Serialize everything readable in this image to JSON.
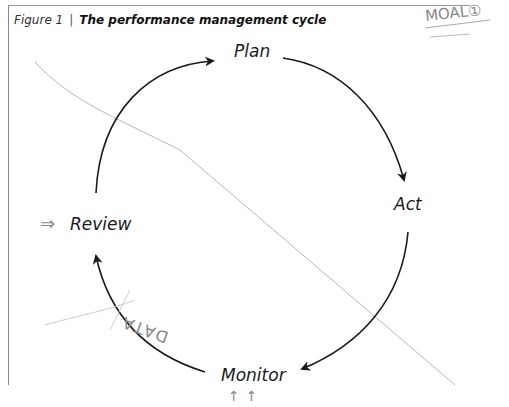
{
  "figure": {
    "number_label": "Figure 1",
    "separator": "|",
    "title": "The performance management cycle"
  },
  "cycle": {
    "stages": [
      {
        "id": "plan",
        "label": "Plan"
      },
      {
        "id": "act",
        "label": "Act"
      },
      {
        "id": "monitor",
        "label": "Monitor"
      },
      {
        "id": "review",
        "label": "Review"
      }
    ],
    "direction": "clockwise"
  },
  "annotations": {
    "top_right": "MOAL①",
    "bottom_left": "DATA",
    "review_arrow": "⇒",
    "monitor_arrows": "↑↑"
  },
  "colors": {
    "ink": "#1a1a1a",
    "pencil": "#9a9a9a",
    "frame": "#8a8a8a"
  }
}
